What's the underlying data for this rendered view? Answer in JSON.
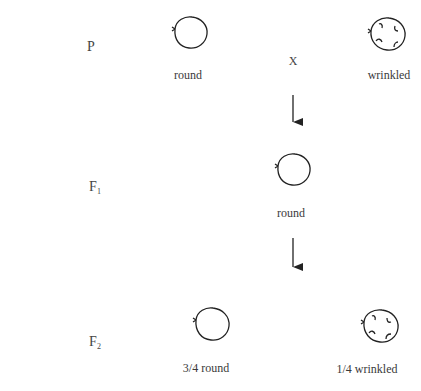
{
  "diagram": {
    "type": "genetic-cross",
    "generations": [
      {
        "id": "P",
        "label": "P",
        "cross_symbol": "X",
        "phenotypes": [
          {
            "label": "round",
            "shape": "round-pea"
          },
          {
            "label": "wrinkled",
            "shape": "wrinkled-pea"
          }
        ]
      },
      {
        "id": "F1",
        "label": "F",
        "subscript": "1",
        "phenotypes": [
          {
            "label": "round",
            "shape": "round-pea"
          }
        ]
      },
      {
        "id": "F2",
        "label": "F",
        "subscript": "2",
        "phenotypes": [
          {
            "label": "3/4 round",
            "shape": "round-pea"
          },
          {
            "label": "1/4 wrinkled",
            "shape": "wrinkled-pea"
          }
        ]
      }
    ],
    "arrows": [
      {
        "from": "P",
        "to": "F1",
        "direction": "down"
      },
      {
        "from": "F1",
        "to": "F2",
        "direction": "down"
      }
    ],
    "colors": {
      "stroke": "#222222",
      "text": "#3a3a3a"
    }
  }
}
